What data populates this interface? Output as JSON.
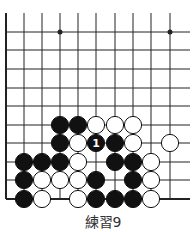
{
  "diagram": {
    "caption": "練習9",
    "grid": {
      "columns_x": [
        6,
        24,
        42,
        60,
        78,
        96,
        115,
        133,
        151,
        170
      ],
      "rows_y": [
        32,
        50,
        69,
        88,
        106,
        125,
        143,
        162,
        180,
        199
      ],
      "right_extent": 190,
      "top_extent": 13
    },
    "star_points": [
      [
        3,
        0
      ],
      [
        9,
        0
      ]
    ],
    "stones": [
      {
        "col": 3,
        "row": 5,
        "color": "black"
      },
      {
        "col": 4,
        "row": 5,
        "color": "black"
      },
      {
        "col": 5,
        "row": 5,
        "color": "white"
      },
      {
        "col": 6,
        "row": 5,
        "color": "white"
      },
      {
        "col": 7,
        "row": 5,
        "color": "white"
      },
      {
        "col": 3,
        "row": 6,
        "color": "black"
      },
      {
        "col": 4,
        "row": 6,
        "color": "white"
      },
      {
        "col": 5,
        "row": 6,
        "color": "black",
        "label": "1"
      },
      {
        "col": 6,
        "row": 6,
        "color": "black"
      },
      {
        "col": 7,
        "row": 6,
        "color": "white"
      },
      {
        "col": 9,
        "row": 6,
        "color": "white"
      },
      {
        "col": 1,
        "row": 7,
        "color": "black"
      },
      {
        "col": 2,
        "row": 7,
        "color": "black"
      },
      {
        "col": 3,
        "row": 7,
        "color": "black"
      },
      {
        "col": 4,
        "row": 7,
        "color": "white"
      },
      {
        "col": 6,
        "row": 7,
        "color": "black"
      },
      {
        "col": 7,
        "row": 7,
        "color": "black"
      },
      {
        "col": 8,
        "row": 7,
        "color": "white"
      },
      {
        "col": 1,
        "row": 8,
        "color": "black"
      },
      {
        "col": 2,
        "row": 8,
        "color": "white"
      },
      {
        "col": 3,
        "row": 8,
        "color": "white"
      },
      {
        "col": 4,
        "row": 8,
        "color": "white"
      },
      {
        "col": 5,
        "row": 8,
        "color": "black"
      },
      {
        "col": 7,
        "row": 8,
        "color": "black"
      },
      {
        "col": 8,
        "row": 8,
        "color": "white"
      },
      {
        "col": 1,
        "row": 9,
        "color": "black"
      },
      {
        "col": 2,
        "row": 9,
        "color": "white"
      },
      {
        "col": 4,
        "row": 9,
        "color": "white"
      },
      {
        "col": 5,
        "row": 9,
        "color": "black"
      },
      {
        "col": 6,
        "row": 9,
        "color": "black"
      },
      {
        "col": 7,
        "row": 9,
        "color": "black"
      },
      {
        "col": 8,
        "row": 9,
        "color": "white"
      }
    ]
  }
}
